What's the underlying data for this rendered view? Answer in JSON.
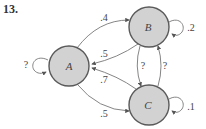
{
  "problem": {
    "number": "13."
  },
  "colors": {
    "node_fill": "#d2d2d2",
    "node_stroke": "#5a5a5a",
    "edge": "#777777",
    "text": "#444444"
  },
  "nodes": [
    {
      "id": "A",
      "label": "A"
    },
    {
      "id": "B",
      "label": "B"
    },
    {
      "id": "C",
      "label": "C"
    }
  ],
  "edges": [
    {
      "from": "A",
      "to": "A",
      "label": "?"
    },
    {
      "from": "B",
      "to": "B",
      "label": ".2"
    },
    {
      "from": "C",
      "to": "C",
      "label": ".1"
    },
    {
      "from": "A",
      "to": "B",
      "label": ".4"
    },
    {
      "from": "B",
      "to": "A",
      "label": ".5"
    },
    {
      "from": "C",
      "to": "A",
      "label": ".7"
    },
    {
      "from": "A",
      "to": "C",
      "label": ".5"
    },
    {
      "from": "B",
      "to": "C",
      "label": "?"
    },
    {
      "from": "C",
      "to": "B",
      "label": "?"
    }
  ]
}
